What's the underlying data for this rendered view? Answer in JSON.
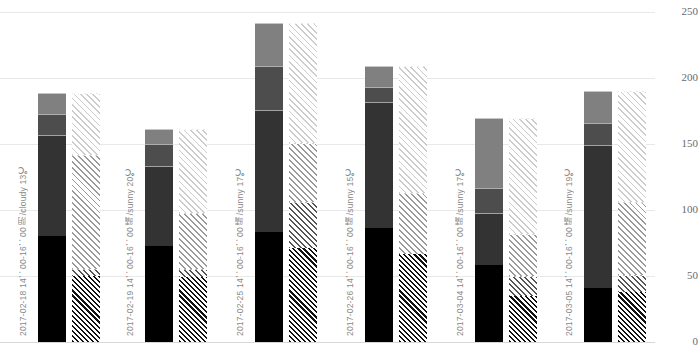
{
  "chart_data": {
    "type": "bar",
    "subtype": "grouped-stacked",
    "title": "",
    "xlabel": "",
    "ylabel": "",
    "ylim": [
      0,
      250
    ],
    "yticks": [
      0,
      50,
      100,
      150,
      200,
      250
    ],
    "ytick_labels": [
      "0",
      "50",
      "100",
      "150",
      "200",
      "250"
    ],
    "grid": true,
    "legend": "none",
    "axis_position": "right",
    "categories": [
      "2017-02-18  14：00-16：00  阴/cloudy  13℃",
      "2017-02-19  14：00-16：00  晴/sunny  20℃",
      "2017-02-25  14：00-16：00  晴/sunny  17℃",
      "2017-02-26  14：00-16：00  晴/sunny  15℃",
      "2017-03-04  14：00-16：00  晴/sunny  17℃",
      "2017-03-05  14：00-16：00  晴/sunny  19℃"
    ],
    "bars": [
      {
        "name": "solid",
        "style": "filled",
        "segment_names": [
          "s1",
          "s2",
          "s3",
          "s4"
        ]
      },
      {
        "name": "hatched",
        "style": "hatched",
        "segment_names": [
          "h1",
          "h2",
          "h3",
          "h4"
        ]
      }
    ],
    "series": [
      {
        "name": "s1",
        "bar": "solid",
        "fill": "#000000",
        "values": [
          80,
          73,
          83,
          86,
          58,
          41
        ]
      },
      {
        "name": "s2",
        "bar": "solid",
        "fill": "#333333",
        "values": [
          77,
          60,
          93,
          96,
          40,
          108
        ]
      },
      {
        "name": "s3",
        "bar": "solid",
        "fill": "#4d4d4d",
        "values": [
          16,
          17,
          33,
          11,
          19,
          17
        ]
      },
      {
        "name": "s4",
        "bar": "solid",
        "fill": "#808080",
        "values": [
          16,
          11,
          33,
          16,
          53,
          24
        ]
      },
      {
        "name": "h1",
        "bar": "hatched",
        "fill": "#111111",
        "values": [
          50,
          49,
          71,
          67,
          35,
          38
        ]
      },
      {
        "name": "h2",
        "bar": "hatched",
        "fill": "#555555",
        "values": [
          5,
          6,
          35,
          0,
          15,
          13
        ]
      },
      {
        "name": "h3",
        "bar": "hatched",
        "fill": "#9a9a9a",
        "values": [
          87,
          43,
          45,
          46,
          32,
          55
        ]
      },
      {
        "name": "h4",
        "bar": "hatched",
        "fill": "#cccccc",
        "values": [
          47,
          63,
          91,
          96,
          88,
          84
        ]
      }
    ],
    "totals_solid": [
      189,
      161,
      242,
      209,
      170,
      190
    ],
    "totals_hatched": [
      189,
      161,
      242,
      209,
      170,
      190
    ]
  },
  "colors": {
    "background": "#ffffff",
    "gridline": "#e8e8e8",
    "axis_text": "#6b6b6b",
    "category_text": "#8a8a8a"
  }
}
